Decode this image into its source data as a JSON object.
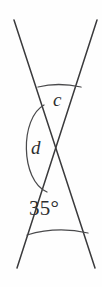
{
  "figure": {
    "background_color": "#fefefe",
    "line_color": "#3a3a3c",
    "arc_color": "#4a4a4c",
    "text_color": "#2e2e30",
    "width": 102,
    "height": 287
  },
  "lines": [
    {
      "name": "line-top-left-to-bottom-right",
      "from": {
        "x": 14,
        "y": 20
      },
      "to": {
        "x": 95,
        "y": 268
      }
    },
    {
      "name": "line-top-right-to-bottom-left",
      "from": {
        "x": 97,
        "y": 20
      },
      "to": {
        "x": 17,
        "y": 268
      }
    }
  ],
  "intersection": {
    "x": 57,
    "y": 148
  },
  "arcs": [
    {
      "name": "arc-c",
      "belongs_to": "c",
      "path": "M 38 87 Q 58 82 81 87"
    },
    {
      "name": "arc-d",
      "belongs_to": "d",
      "path": "M 44 105 C 20 118 20 180 47 192"
    },
    {
      "name": "arc-35",
      "belongs_to": "35°",
      "path": "M 27 235 Q 57 226 88 233"
    }
  ],
  "labels": {
    "c": "c",
    "d": "d",
    "angle_35": "35°"
  },
  "angles": [
    {
      "id": "c",
      "label": "c",
      "position": "upper",
      "value": null,
      "unit": "degrees"
    },
    {
      "id": "d",
      "label": "d",
      "position": "left",
      "value": null,
      "unit": "degrees"
    },
    {
      "id": "a35",
      "label": "35°",
      "position": "lower",
      "value": 35,
      "unit": "degrees"
    }
  ]
}
